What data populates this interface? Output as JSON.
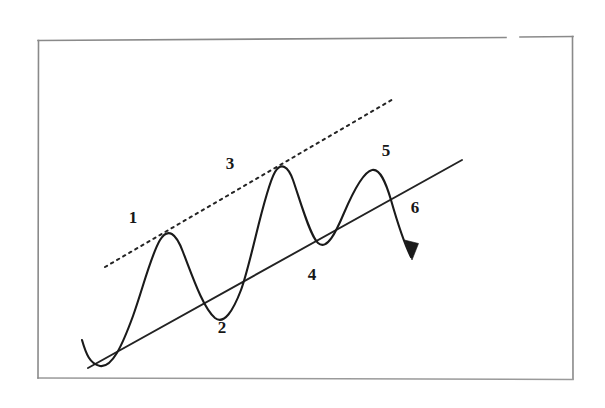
{
  "figure": {
    "background_color": "#ffffff",
    "ink_color": "#1a1a1a",
    "frame_color": "#8a8a8a",
    "frame": {
      "name": "outer-border",
      "x": 38,
      "y": 40,
      "width": 535,
      "height": 339,
      "top_gap": {
        "from_x": 506,
        "to_x": 520
      }
    }
  },
  "labels": [
    {
      "id": "1",
      "text": "1",
      "x": 133,
      "y": 219,
      "describes": "first-peak"
    },
    {
      "id": "2",
      "text": "2",
      "x": 222,
      "y": 329,
      "describes": "first-trough-on-support"
    },
    {
      "id": "3",
      "text": "3",
      "x": 230,
      "y": 165,
      "describes": "second-peak-on-resistance"
    },
    {
      "id": "4",
      "text": "4",
      "x": 312,
      "y": 276,
      "describes": "second-trough-on-support"
    },
    {
      "id": "5",
      "text": "5",
      "x": 386,
      "y": 152,
      "describes": "third-peak-below-resistance"
    },
    {
      "id": "6",
      "text": "6",
      "x": 415,
      "y": 209,
      "describes": "breakdown-through-support"
    }
  ],
  "chart_data": {
    "type": "line",
    "subtitle": "Hand-drawn technical-analysis price pattern",
    "xlabel": "",
    "ylabel": "",
    "grid": false,
    "legend": "none",
    "xlim": [
      38,
      573
    ],
    "ylim": [
      40,
      379
    ],
    "note": "y values are screen pixels; smaller y = higher price",
    "series": [
      {
        "name": "price-curve",
        "style": "solid",
        "points": [
          {
            "x": 82,
            "y": 340,
            "kind": "start"
          },
          {
            "x": 100,
            "y": 366,
            "kind": "trough"
          },
          {
            "x": 160,
            "y": 240,
            "kind": "peak",
            "label": "1"
          },
          {
            "x": 215,
            "y": 318,
            "kind": "trough",
            "label": "2"
          },
          {
            "x": 275,
            "y": 172,
            "kind": "peak",
            "label": "3"
          },
          {
            "x": 318,
            "y": 243,
            "kind": "trough",
            "label": "4"
          },
          {
            "x": 372,
            "y": 170,
            "kind": "peak",
            "label": "5"
          },
          {
            "x": 412,
            "y": 258,
            "kind": "breakdown-end",
            "label": "6"
          }
        ]
      },
      {
        "name": "resistance-trendline",
        "style": "dotted",
        "touches": [
          "1",
          "3"
        ],
        "points": [
          {
            "x": 105,
            "y": 267
          },
          {
            "x": 395,
            "y": 98
          }
        ]
      },
      {
        "name": "support-trendline",
        "style": "solid",
        "touches": [
          "2",
          "4"
        ],
        "points": [
          {
            "x": 88,
            "y": 368
          },
          {
            "x": 462,
            "y": 160
          }
        ]
      }
    ],
    "annotations": [
      {
        "name": "breakdown-arrow",
        "type": "arrow",
        "tip_x": 412,
        "tip_y": 258,
        "direction": "down-right"
      }
    ]
  }
}
